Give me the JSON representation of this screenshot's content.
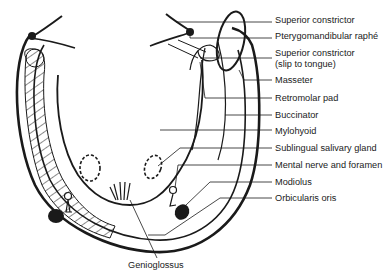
{
  "figure": {
    "type": "anatomical-diagram",
    "labels": [
      {
        "id": "superior-constrictor",
        "text": "Superior constrictor",
        "y": 20
      },
      {
        "id": "pterygomandibular-raphe",
        "text": "Pterygomandibular raphé",
        "y": 36
      },
      {
        "id": "superior-constrictor-slip-1",
        "text": "Superior constrictor",
        "y": 53
      },
      {
        "id": "superior-constrictor-slip-2",
        "text": "(slip to tongue)",
        "y": 64
      },
      {
        "id": "masseter",
        "text": "Masseter",
        "y": 80
      },
      {
        "id": "retromolar-pad",
        "text": "Retromolar pad",
        "y": 98
      },
      {
        "id": "buccinator",
        "text": "Buccinator",
        "y": 114
      },
      {
        "id": "mylohyoid",
        "text": "Mylohyoid",
        "y": 131
      },
      {
        "id": "sublingual-salivary-gland",
        "text": "Sublingual salivary gland",
        "y": 148
      },
      {
        "id": "mental-nerve-foramen",
        "text": "Mental nerve and foramen",
        "y": 164
      },
      {
        "id": "modiolus",
        "text": "Modiolus",
        "y": 181
      },
      {
        "id": "orbicularis-oris",
        "text": "Orbicularis oris",
        "y": 197
      },
      {
        "id": "genioglossus",
        "text": "Genioglossus",
        "y": 266
      }
    ],
    "colors": {
      "ink": "#1a1a1a",
      "background": "#ffffff"
    }
  }
}
